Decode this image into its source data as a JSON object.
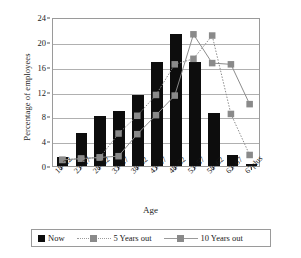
{
  "chart_data": {
    "type": "bar",
    "title": "",
    "xlabel": "Age",
    "ylabel": "Percentage of employees",
    "ylim": [
      0,
      24
    ],
    "yticks": [
      0,
      4,
      8,
      12,
      16,
      20,
      24
    ],
    "grid": true,
    "legend_position": "bottom",
    "categories": [
      "18–22",
      "23–27",
      "28–32",
      "33–37",
      "38–42",
      "43–47",
      "48–52",
      "53–57",
      "58–62",
      "63–67",
      "67plus"
    ],
    "series": [
      {
        "name": "Now",
        "type": "bar",
        "color": "#0d0d0d",
        "values": [
          1.5,
          5.3,
          8.0,
          8.8,
          11.4,
          16.8,
          21.3,
          16.8,
          8.5,
          1.7,
          0.3
        ]
      },
      {
        "name": "5 Years out",
        "type": "line",
        "linestyle": "dotted",
        "color": "#8a8a8a",
        "marker": "square",
        "values": [
          1.0,
          1.2,
          1.4,
          5.3,
          8.2,
          11.6,
          16.6,
          17.5,
          21.3,
          8.5,
          1.8
        ]
      },
      {
        "name": "10 Years out",
        "type": "line",
        "linestyle": "solid",
        "color": "#8a8a8a",
        "marker": "square",
        "values": [
          1.0,
          1.2,
          1.4,
          1.6,
          5.2,
          8.3,
          11.5,
          21.5,
          16.8,
          16.6,
          10.1
        ]
      }
    ]
  },
  "legend": {
    "items": [
      {
        "label": "Now"
      },
      {
        "label": "5 Years out"
      },
      {
        "label": "10 Years out"
      }
    ]
  }
}
